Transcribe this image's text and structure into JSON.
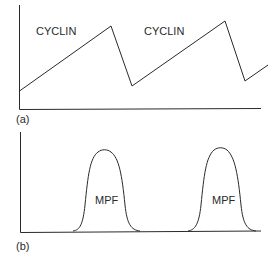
{
  "diagram": {
    "panels": [
      {
        "id": "a",
        "panel_label": "(a)",
        "curve_labels": [
          "CYCLIN",
          "CYCLIN"
        ],
        "description": "Sawtooth curve: cyclin gradually accumulates then drops sharply"
      },
      {
        "id": "b",
        "panel_label": "(b)",
        "curve_labels": [
          "MPF",
          "MPF"
        ],
        "description": "Two bell-shaped peaks of MPF activity"
      }
    ],
    "colors": {
      "line": "#2a2a2a",
      "background": "#ffffff"
    }
  }
}
